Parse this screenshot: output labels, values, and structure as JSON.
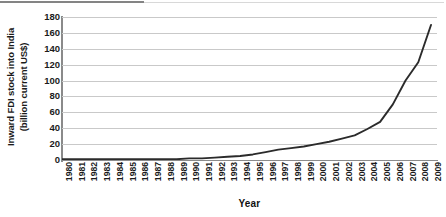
{
  "chart_data": {
    "type": "line",
    "title": "",
    "xlabel": "Year",
    "ylabel": "Inward FDI stock into India (billion current US$)",
    "ylabel_line1": "Inward FDI stock into India",
    "ylabel_line2": "(billion current US$)",
    "ylim": [
      0,
      180
    ],
    "yticks": [
      0,
      20,
      40,
      60,
      80,
      100,
      120,
      140,
      160,
      180
    ],
    "ytick_labels": [
      "0",
      "20",
      "40",
      "60",
      "80",
      "100",
      "120",
      "140",
      "160",
      "180"
    ],
    "grid": "horizontal",
    "legend": "none",
    "line_color": "#2b2b2b",
    "grid_color": "#c9c9c9",
    "axis_color": "#8a8a8a",
    "categories": [
      "1980",
      "1981",
      "1982",
      "1983",
      "1984",
      "1985",
      "1986",
      "1987",
      "1988",
      "1989",
      "1990",
      "1991",
      "1992",
      "1993",
      "1994",
      "1995",
      "1996",
      "1997",
      "1998",
      "1999",
      "2000",
      "2001",
      "2002",
      "2003",
      "2004",
      "2005",
      "2006",
      "2007",
      "2008",
      "2009"
    ],
    "series": [
      {
        "name": "Inward FDI stock into India",
        "values": [
          1,
          1,
          1,
          1,
          1,
          1,
          1,
          1,
          1,
          1,
          2,
          2,
          3,
          4,
          5,
          7,
          10,
          13,
          15,
          17,
          20,
          23,
          27,
          31,
          39,
          48,
          70,
          100,
          123,
          170
        ]
      }
    ]
  }
}
